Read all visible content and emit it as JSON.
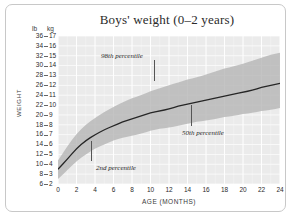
{
  "figure": {
    "title": "Boys' weight (0–2 years)",
    "y_axis_label": "WEIGHT",
    "x_axis_label": "AGE (MONTHS)",
    "unit_left": "lb",
    "unit_right": "kg"
  },
  "colors": {
    "plot_background": "#ebebeb",
    "gridline": "#ffffff",
    "band_fill": "#b4b4b4",
    "median_line": "#262626",
    "frame_border": "#c8c8c8",
    "text": "#2b2b2b"
  },
  "annotations": [
    {
      "name": "p98-label",
      "text": "98th percentile"
    },
    {
      "name": "p50-label",
      "text": "50th percentile"
    },
    {
      "name": "p02-label",
      "text": "2nd percentile"
    }
  ],
  "chart_data": {
    "type": "area",
    "title": "Boys' weight (0–2 years)",
    "subtitle": "",
    "xlabel": "AGE (MONTHS)",
    "ylabel": "WEIGHT",
    "xlim": [
      0,
      24
    ],
    "ylim_kg": [
      2,
      17
    ],
    "ylim_lb": [
      6,
      36
    ],
    "grid": true,
    "legend_position": "inline-annotations",
    "x_ticks": [
      0,
      2,
      4,
      6,
      8,
      10,
      12,
      14,
      16,
      18,
      20,
      22,
      24
    ],
    "y_ticks_kg": [
      2,
      3,
      4,
      5,
      6,
      7,
      8,
      9,
      10,
      11,
      12,
      13,
      14,
      15,
      16,
      17
    ],
    "y_ticks_lb": [
      6,
      8,
      10,
      12,
      14,
      16,
      18,
      20,
      22,
      24,
      26,
      28,
      30,
      32,
      34,
      36
    ],
    "x": [
      0,
      1,
      2,
      3,
      4,
      5,
      6,
      7,
      8,
      9,
      10,
      11,
      12,
      13,
      14,
      15,
      16,
      17,
      18,
      19,
      20,
      21,
      22,
      23,
      24
    ],
    "series": [
      {
        "name": "2nd percentile",
        "unit": "kg",
        "values": [
          2.5,
          3.4,
          4.3,
          5.0,
          5.6,
          6.0,
          6.4,
          6.7,
          6.9,
          7.1,
          7.4,
          7.6,
          7.7,
          7.9,
          8.1,
          8.3,
          8.4,
          8.6,
          8.8,
          8.9,
          9.1,
          9.2,
          9.4,
          9.5,
          9.7
        ]
      },
      {
        "name": "50th percentile",
        "unit": "kg",
        "values": [
          3.5,
          4.5,
          5.6,
          6.4,
          7.0,
          7.5,
          7.9,
          8.3,
          8.6,
          8.9,
          9.2,
          9.4,
          9.6,
          9.9,
          10.1,
          10.3,
          10.5,
          10.7,
          10.9,
          11.1,
          11.3,
          11.5,
          11.8,
          12.0,
          12.2
        ]
      },
      {
        "name": "98th percentile",
        "unit": "kg",
        "values": [
          4.4,
          5.8,
          7.1,
          8.0,
          8.7,
          9.3,
          9.8,
          10.3,
          10.7,
          11.0,
          11.4,
          11.7,
          12.0,
          12.3,
          12.6,
          12.8,
          13.1,
          13.4,
          13.7,
          13.9,
          14.2,
          14.5,
          14.8,
          15.1,
          15.3
        ]
      }
    ]
  }
}
